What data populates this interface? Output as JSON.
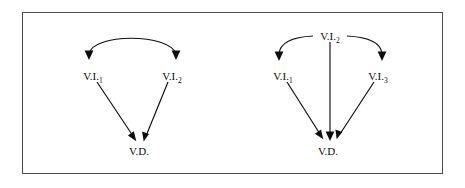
{
  "figure": {
    "background_color": "#ffffff",
    "frame_color": "#4a4a4a",
    "ink_color": "#0d0d0d",
    "panels": [
      {
        "id": "left-panel",
        "name": "two-independent-variables-model",
        "nodes": [
          {
            "id": "vi1",
            "base": "V.I.",
            "subscript": "1",
            "x": 93,
            "y": 76
          },
          {
            "id": "vi2",
            "base": "V.I.",
            "subscript": "2",
            "x": 172,
            "y": 76
          },
          {
            "id": "vd",
            "base": "V.D.",
            "subscript": "",
            "x": 139,
            "y": 153
          }
        ],
        "edges": [
          {
            "id": "vi1-vi2-arc",
            "from": "vi1",
            "to": "vi2",
            "style": "curved",
            "heads": "both"
          },
          {
            "id": "vi1-vd",
            "from": "vi1",
            "to": "vd",
            "style": "straight",
            "heads": "end"
          },
          {
            "id": "vi2-vd",
            "from": "vi2",
            "to": "vd",
            "style": "straight",
            "heads": "end"
          }
        ]
      },
      {
        "id": "right-panel",
        "name": "three-independent-variables-model",
        "nodes": [
          {
            "id": "vi2",
            "base": "V.I.",
            "subscript": "2",
            "x": 330,
            "y": 36
          },
          {
            "id": "vi1",
            "base": "V.I.",
            "subscript": "1",
            "x": 283,
            "y": 76
          },
          {
            "id": "vi3",
            "base": "V.I.",
            "subscript": "3",
            "x": 378,
            "y": 76
          },
          {
            "id": "vd",
            "base": "V.D.",
            "subscript": "",
            "x": 328,
            "y": 153
          }
        ],
        "edges": [
          {
            "id": "vi2-vi1-arc",
            "from": "vi2",
            "to": "vi1",
            "style": "curved",
            "heads": "end"
          },
          {
            "id": "vi2-vi3-arc",
            "from": "vi2",
            "to": "vi3",
            "style": "curved",
            "heads": "end"
          },
          {
            "id": "vi2-vd",
            "from": "vi2",
            "to": "vd",
            "style": "straight",
            "heads": "end"
          },
          {
            "id": "vi1-vd",
            "from": "vi1",
            "to": "vd",
            "style": "straight",
            "heads": "end"
          },
          {
            "id": "vi3-vd",
            "from": "vi3",
            "to": "vd",
            "style": "straight",
            "heads": "end"
          }
        ]
      }
    ]
  }
}
